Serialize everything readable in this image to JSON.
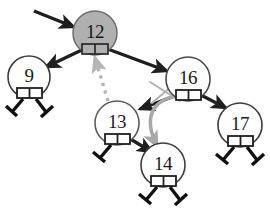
{
  "diagram": {
    "caption": "",
    "colors": {
      "stroke": "#1f1f1f",
      "node_outline": "#5a5a5a",
      "root_fill": "#b0b0b0",
      "node_fill": "#ffffff",
      "highlight_gray": "#a8a8a8",
      "dashed_gray": "#b4b4b4",
      "background": "#ffffff"
    },
    "nodes": [
      {
        "id": "n12",
        "label": "12",
        "cx": 95,
        "cy": 33,
        "r": 22,
        "shaded": true,
        "left_child": "n9",
        "right_child": "n16"
      },
      {
        "id": "n9",
        "label": "9",
        "cx": 29,
        "cy": 77,
        "r": 21,
        "shaded": false,
        "left_child": null,
        "right_child": null
      },
      {
        "id": "n16",
        "label": "16",
        "cx": 188,
        "cy": 79,
        "r": 22,
        "shaded": false,
        "left_child": "n13",
        "right_child": "n17"
      },
      {
        "id": "n13",
        "label": "13",
        "cx": 117,
        "cy": 123,
        "r": 22,
        "shaded": false,
        "left_child": null,
        "right_child": "n14"
      },
      {
        "id": "n17",
        "label": "17",
        "cx": 240,
        "cy": 125,
        "r": 22,
        "shaded": false,
        "left_child": null,
        "right_child": null
      },
      {
        "id": "n14",
        "label": "14",
        "cx": 163,
        "cy": 165,
        "r": 22,
        "shaded": false,
        "left_child": null,
        "right_child": null
      }
    ],
    "edges": [
      {
        "from": "root-pointer",
        "to": "n12",
        "style": "solid-black"
      },
      {
        "from": "n12",
        "to": "n9",
        "style": "solid-black"
      },
      {
        "from": "n12",
        "to": "n16",
        "style": "solid-black"
      },
      {
        "from": "n16",
        "to": "n13",
        "style": "solid-black"
      },
      {
        "from": "n16",
        "to": "n17",
        "style": "solid-black"
      },
      {
        "from": "n13",
        "to": "n14",
        "style": "solid-black"
      }
    ],
    "annotations": [
      {
        "kind": "dashed-arrow-gray",
        "from": "n13",
        "to": "n12",
        "meaning": "successor replaces deleted node"
      },
      {
        "kind": "curved-arrow-gray",
        "from": "n16-left-pointer",
        "to": "n14",
        "meaning": "relink left child to 14"
      },
      {
        "kind": "cross-out-gray",
        "at": "n16-left-pointer",
        "meaning": "old link removed"
      }
    ]
  }
}
